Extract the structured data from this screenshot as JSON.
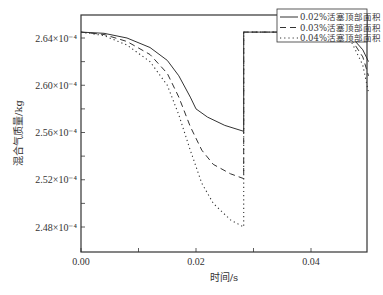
{
  "chart_data": {
    "type": "line",
    "title": "",
    "xlabel": "时间/s",
    "ylabel": "混合气质量/kg",
    "xlim": [
      0,
      0.05
    ],
    "ylim": [
      0.000246,
      0.000266
    ],
    "x_ticks": [
      0.0,
      0.01,
      0.02,
      0.03,
      0.04
    ],
    "x_tick_labels": [
      "0.00",
      "",
      "0.02",
      "",
      "0.04"
    ],
    "y_ticks": [
      0.000248,
      0.00025,
      0.000252,
      0.000254,
      0.000256,
      0.000258,
      0.00026,
      0.000262,
      0.000264
    ],
    "y_tick_labels": [
      "2.48×10⁻⁴",
      "",
      "2.52×10⁻⁴",
      "",
      "2.56×10⁻⁴",
      "",
      "2.60×10⁻⁴",
      "",
      "2.64×10⁻⁴"
    ],
    "grid": false,
    "legend_position": "upper right",
    "series": [
      {
        "name": "0.02%活塞顶部面积",
        "style": "solid",
        "x": [
          0.0,
          0.004,
          0.008,
          0.012,
          0.015,
          0.017,
          0.019,
          0.02,
          0.022,
          0.025,
          0.0283,
          0.0283,
          0.0455,
          0.047,
          0.049,
          0.05
        ],
        "y": [
          2.645,
          2.644,
          2.64,
          2.632,
          2.621,
          2.608,
          2.59,
          2.58,
          2.573,
          2.566,
          2.561,
          2.645,
          2.645,
          2.641,
          2.63,
          2.62
        ]
      },
      {
        "name": "0.03%活塞顶部面积",
        "style": "dashed",
        "x": [
          0.0,
          0.004,
          0.008,
          0.012,
          0.015,
          0.017,
          0.019,
          0.021,
          0.023,
          0.026,
          0.0283,
          0.0283,
          0.0455,
          0.047,
          0.049,
          0.05
        ],
        "y": [
          2.645,
          2.643,
          2.637,
          2.626,
          2.61,
          2.59,
          2.565,
          2.545,
          2.533,
          2.525,
          2.521,
          2.645,
          2.645,
          2.639,
          2.624,
          2.608
        ]
      },
      {
        "name": "0.04%活塞顶部面积",
        "style": "dotted",
        "x": [
          0.0,
          0.004,
          0.008,
          0.012,
          0.015,
          0.017,
          0.019,
          0.021,
          0.023,
          0.026,
          0.0283,
          0.0283,
          0.0455,
          0.047,
          0.049,
          0.05
        ],
        "y": [
          2.645,
          2.642,
          2.634,
          2.62,
          2.6,
          2.575,
          2.545,
          2.517,
          2.5,
          2.486,
          2.48,
          2.645,
          2.645,
          2.637,
          2.617,
          2.594
        ]
      }
    ],
    "y_unit_scale": "×10⁻⁴"
  },
  "legend": {
    "items": [
      {
        "label": "0.02%活塞顶部面积",
        "style": "solid"
      },
      {
        "label": "0.03%活塞顶部面积",
        "style": "dashed"
      },
      {
        "label": "0.04%活塞顶部面积",
        "style": "dotted"
      }
    ]
  },
  "colors": {
    "axis": "#333333",
    "line": "#333333",
    "background": "#ffffff"
  }
}
